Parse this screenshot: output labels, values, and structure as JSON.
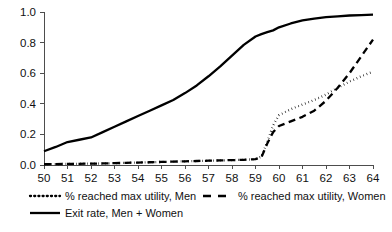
{
  "chart_data": {
    "type": "line",
    "title": "",
    "subtitle": "",
    "xlabel": "",
    "ylabel": "",
    "xlim": [
      50,
      64
    ],
    "ylim": [
      0,
      1.0
    ],
    "grid": false,
    "legend_position": "bottom",
    "x_tick_labels": [
      "50",
      "51",
      "52",
      "53",
      "54",
      "55",
      "56",
      "57",
      "58",
      "59",
      "60",
      "61",
      "62",
      "63",
      "64"
    ],
    "y_tick_labels": [
      "0.0",
      "0.2",
      "0.4",
      "0.6",
      "0.8",
      "1.0"
    ],
    "x_ticks": [
      50,
      51,
      52,
      53,
      54,
      55,
      56,
      57,
      58,
      59,
      60,
      61,
      62,
      63,
      64
    ],
    "y_ticks": [
      0.0,
      0.2,
      0.4,
      0.6,
      0.8,
      1.0
    ],
    "x": [
      50,
      50.5,
      51,
      51.5,
      52,
      52.5,
      53,
      53.5,
      54,
      54.5,
      55,
      55.5,
      56,
      56.5,
      57,
      57.5,
      58,
      58.5,
      59,
      59.25,
      59.5,
      59.75,
      60,
      60.5,
      61,
      61.5,
      62,
      62.5,
      63,
      63.5,
      64
    ],
    "series": [
      {
        "name": "% reached max utility, Men",
        "style": "dotted",
        "color": "#000000",
        "values": [
          0.005,
          0.006,
          0.007,
          0.008,
          0.009,
          0.01,
          0.012,
          0.014,
          0.016,
          0.018,
          0.02,
          0.022,
          0.024,
          0.026,
          0.028,
          0.03,
          0.032,
          0.034,
          0.038,
          0.055,
          0.15,
          0.26,
          0.325,
          0.365,
          0.395,
          0.425,
          0.46,
          0.505,
          0.545,
          0.58,
          0.61
        ]
      },
      {
        "name": "% reached max utility, Women",
        "style": "dashed",
        "color": "#000000",
        "values": [
          0.005,
          0.006,
          0.007,
          0.008,
          0.009,
          0.01,
          0.012,
          0.014,
          0.016,
          0.018,
          0.02,
          0.022,
          0.024,
          0.026,
          0.028,
          0.03,
          0.032,
          0.034,
          0.038,
          0.05,
          0.14,
          0.215,
          0.255,
          0.285,
          0.315,
          0.355,
          0.42,
          0.505,
          0.6,
          0.71,
          0.82
        ]
      },
      {
        "name": "Exit rate, Men + Women",
        "style": "solid",
        "color": "#000000",
        "values": [
          0.09,
          0.118,
          0.15,
          0.165,
          0.18,
          0.215,
          0.25,
          0.285,
          0.32,
          0.355,
          0.39,
          0.425,
          0.47,
          0.52,
          0.58,
          0.645,
          0.715,
          0.785,
          0.84,
          0.855,
          0.868,
          0.88,
          0.9,
          0.925,
          0.945,
          0.957,
          0.966,
          0.972,
          0.977,
          0.98,
          0.983
        ]
      }
    ],
    "legend_entries": [
      {
        "label": "% reached max utility, Men",
        "style": "dotted"
      },
      {
        "label": "% reached max utility, Women",
        "style": "dashed"
      },
      {
        "label": "Exit rate, Men + Women",
        "style": "solid"
      }
    ]
  },
  "layout": {
    "plot_left": 44,
    "plot_right": 373,
    "plot_top": 12,
    "plot_bottom": 165
  }
}
